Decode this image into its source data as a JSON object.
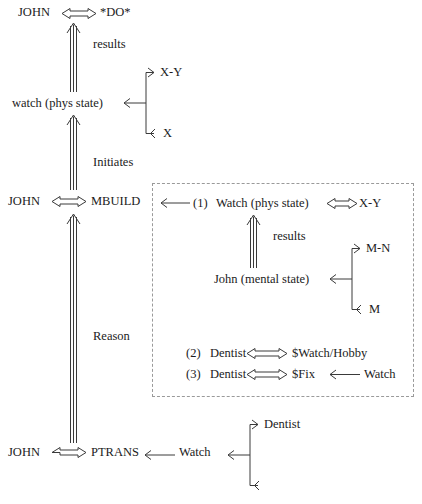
{
  "diagram": {
    "title_note": "Conceptual dependency representation of a watch-repair story",
    "colors": {
      "ink": "#1b1b1b",
      "line": "#3a3a3a",
      "box_border": "#9a9a9a",
      "background": "#ffffff"
    },
    "top_level": {
      "act1": {
        "actor": "JOHN",
        "action": "*DO*",
        "link_label": "results"
      },
      "state1": {
        "object": "watch (phys state)",
        "branch_top": "X-Y",
        "branch_bottom": "X"
      },
      "link_label_initiates": "Initiates",
      "act2": {
        "actor": "JOHN",
        "action": "MBUILD"
      },
      "link_label_reason": "Reason",
      "act3": {
        "actor": "JOHN",
        "action": "PTRANS",
        "object": "Watch",
        "branch_top": "Dentist",
        "branch_bottom": ""
      }
    },
    "inner_box": {
      "line1": {
        "number": "(1)",
        "actor": "Watch (phys state)",
        "value": "X-Y",
        "link_label": "results",
        "mental": {
          "actor": "John (mental state)",
          "branch_top": "M-N",
          "branch_bottom": "M"
        }
      },
      "line2": {
        "number": "(2)",
        "actor": "Dentist",
        "value": "$Watch/Hobby"
      },
      "line3": {
        "number": "(3)",
        "actor": "Dentist",
        "value": "$Fix",
        "source": "Watch"
      }
    },
    "icons": {
      "double_arrow": "double-headed-horizontal-arrow-icon",
      "triple_arrow_up": "triple-line-up-arrow-icon",
      "left_arrow": "left-arrow-icon",
      "brace": "state-brace-icon"
    }
  }
}
